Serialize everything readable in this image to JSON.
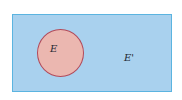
{
  "diagram": {
    "type": "venn",
    "universe": {
      "label": "E'",
      "color": "#a9d1ee",
      "border_color": "#5bb4e0"
    },
    "sets": [
      {
        "label": "E",
        "color": "#ebb7b0",
        "border_color": "#b24a5a"
      }
    ]
  }
}
